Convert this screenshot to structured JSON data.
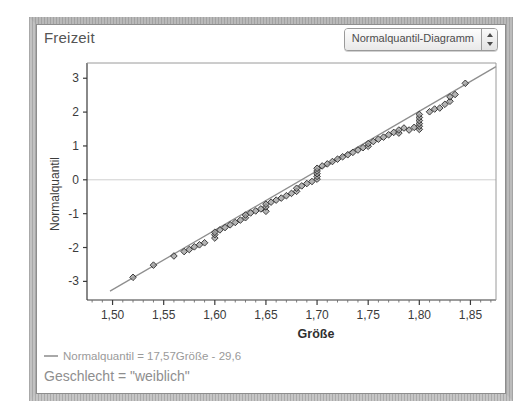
{
  "window": {
    "panel_title": "Freizeit"
  },
  "toolbar": {
    "chart_type_value": "Normalquantil-Diagramm",
    "stepper_up_icon": "triangle-up-icon",
    "stepper_down_icon": "triangle-down-icon"
  },
  "footer": {
    "legend_equation": "Normalquantil = 17,57Größe - 29,6",
    "group_label": "Geschlecht = \"weiblich\"",
    "legend_swatch_color": "#a8a8a8"
  },
  "colors": {
    "marker_fill": "#9b9b9b",
    "marker_stroke": "#2b2b2b",
    "fit_line": "#8e8e8e",
    "zero_line": "#cfcfcf",
    "axis": "#3a3a3a"
  },
  "chart_data": {
    "type": "scatter",
    "title": "Freizeit",
    "subtitle": "Normalquantil-Diagramm",
    "xlabel": "Größe",
    "ylabel": "Normalquantil",
    "xlim": [
      1.475,
      1.875
    ],
    "ylim": [
      -3.55,
      3.45
    ],
    "xticks": [
      1.5,
      1.55,
      1.6,
      1.65,
      1.7,
      1.75,
      1.8,
      1.85
    ],
    "xtick_labels": [
      "1,50",
      "1,55",
      "1,60",
      "1,65",
      "1,70",
      "1,75",
      "1,80",
      "1,85"
    ],
    "yticks": [
      3,
      2,
      1,
      0,
      -1,
      -2,
      -3
    ],
    "ytick_labels": [
      "3",
      "2",
      "1",
      "0",
      "-1",
      "-2",
      "-3"
    ],
    "grid": false,
    "zero_reference_line": 0,
    "legend_position": "below-axes",
    "fit_line": {
      "label": "Normalquantil = 17,57Größe - 29,6",
      "slope": 17.57,
      "intercept": -29.6,
      "x_start": 1.4975,
      "x_end": 1.875
    },
    "annotations": [
      "Geschlecht = \"weiblich\""
    ],
    "marker": "diamond",
    "points": [
      {
        "x": 1.52,
        "y": -2.88
      },
      {
        "x": 1.54,
        "y": -2.52
      },
      {
        "x": 1.56,
        "y": -2.25
      },
      {
        "x": 1.57,
        "y": -2.12
      },
      {
        "x": 1.575,
        "y": -2.06
      },
      {
        "x": 1.58,
        "y": -1.98
      },
      {
        "x": 1.585,
        "y": -1.92
      },
      {
        "x": 1.59,
        "y": -1.86
      },
      {
        "x": 1.6,
        "y": -1.72
      },
      {
        "x": 1.6,
        "y": -1.62
      },
      {
        "x": 1.6,
        "y": -1.55
      },
      {
        "x": 1.605,
        "y": -1.48
      },
      {
        "x": 1.61,
        "y": -1.41
      },
      {
        "x": 1.615,
        "y": -1.33
      },
      {
        "x": 1.62,
        "y": -1.26
      },
      {
        "x": 1.625,
        "y": -1.19
      },
      {
        "x": 1.63,
        "y": -1.12
      },
      {
        "x": 1.63,
        "y": -1.04
      },
      {
        "x": 1.635,
        "y": -0.98
      },
      {
        "x": 1.64,
        "y": -0.92
      },
      {
        "x": 1.645,
        "y": -0.86
      },
      {
        "x": 1.65,
        "y": -0.93
      },
      {
        "x": 1.65,
        "y": -0.8
      },
      {
        "x": 1.65,
        "y": -0.72
      },
      {
        "x": 1.655,
        "y": -0.66
      },
      {
        "x": 1.66,
        "y": -0.6
      },
      {
        "x": 1.665,
        "y": -0.54
      },
      {
        "x": 1.67,
        "y": -0.47
      },
      {
        "x": 1.675,
        "y": -0.4
      },
      {
        "x": 1.68,
        "y": -0.34
      },
      {
        "x": 1.68,
        "y": -0.25
      },
      {
        "x": 1.685,
        "y": -0.18
      },
      {
        "x": 1.69,
        "y": -0.11
      },
      {
        "x": 1.695,
        "y": -0.05
      },
      {
        "x": 1.7,
        "y": 0.02
      },
      {
        "x": 1.7,
        "y": 0.1
      },
      {
        "x": 1.7,
        "y": 0.18
      },
      {
        "x": 1.7,
        "y": 0.26
      },
      {
        "x": 1.7,
        "y": 0.34
      },
      {
        "x": 1.705,
        "y": 0.41
      },
      {
        "x": 1.71,
        "y": 0.47
      },
      {
        "x": 1.715,
        "y": 0.54
      },
      {
        "x": 1.72,
        "y": 0.61
      },
      {
        "x": 1.725,
        "y": 0.68
      },
      {
        "x": 1.73,
        "y": 0.74
      },
      {
        "x": 1.735,
        "y": 0.81
      },
      {
        "x": 1.74,
        "y": 0.88
      },
      {
        "x": 1.745,
        "y": 0.95
      },
      {
        "x": 1.75,
        "y": 0.99
      },
      {
        "x": 1.75,
        "y": 1.07
      },
      {
        "x": 1.755,
        "y": 1.13
      },
      {
        "x": 1.76,
        "y": 1.2
      },
      {
        "x": 1.765,
        "y": 1.26
      },
      {
        "x": 1.77,
        "y": 1.33
      },
      {
        "x": 1.775,
        "y": 1.4
      },
      {
        "x": 1.78,
        "y": 1.38
      },
      {
        "x": 1.78,
        "y": 1.47
      },
      {
        "x": 1.785,
        "y": 1.53
      },
      {
        "x": 1.79,
        "y": 1.47
      },
      {
        "x": 1.795,
        "y": 1.55
      },
      {
        "x": 1.8,
        "y": 1.49
      },
      {
        "x": 1.8,
        "y": 1.58
      },
      {
        "x": 1.8,
        "y": 1.66
      },
      {
        "x": 1.8,
        "y": 1.75
      },
      {
        "x": 1.8,
        "y": 1.84
      },
      {
        "x": 1.8,
        "y": 1.93
      },
      {
        "x": 1.81,
        "y": 2.01
      },
      {
        "x": 1.815,
        "y": 2.09
      },
      {
        "x": 1.82,
        "y": 2.12
      },
      {
        "x": 1.825,
        "y": 2.23
      },
      {
        "x": 1.83,
        "y": 2.32
      },
      {
        "x": 1.83,
        "y": 2.45
      },
      {
        "x": 1.835,
        "y": 2.52
      },
      {
        "x": 1.845,
        "y": 2.85
      }
    ]
  }
}
